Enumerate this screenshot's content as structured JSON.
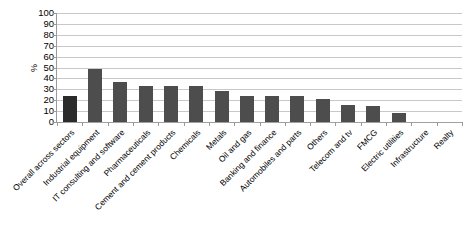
{
  "chart_data": {
    "type": "bar",
    "title": "",
    "subtitle": "",
    "xlabel": "",
    "ylabel": "%",
    "ylim": [
      0,
      100
    ],
    "ytick_step": 10,
    "yticks": [
      100,
      90,
      80,
      70,
      60,
      50,
      40,
      30,
      20,
      10,
      0
    ],
    "grid": true,
    "legend": false,
    "legend_position": "none",
    "orientation": "vertical",
    "bar_color": "#4d4d4d",
    "first_bar_color": "#2b2b2b",
    "categories": [
      "Overall across sectors",
      "Industrial equipment",
      "IT consulting and software",
      "Pharmaceuticals",
      "Cement and cement products",
      "Chemicals",
      "Metals",
      "Oil and gas",
      "Banking and finance",
      "Automobiles and parts",
      "Others",
      "Telecom and tv",
      "FMCG",
      "Electric utilities",
      "Infrastructure",
      "Realty"
    ],
    "values": [
      24,
      49,
      37,
      33,
      33,
      33,
      28,
      24,
      24,
      24,
      21,
      16,
      15,
      8,
      0,
      0
    ]
  }
}
